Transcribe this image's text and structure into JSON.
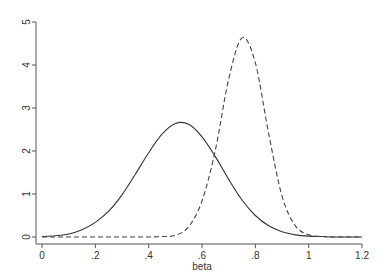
{
  "chart_data": {
    "type": "line",
    "title": "",
    "xlabel": "beta",
    "ylabel": "",
    "xlim": [
      0,
      1.2
    ],
    "ylim": [
      0,
      5
    ],
    "grid": false,
    "legend": null,
    "x_ticks": [
      0,
      0.2,
      0.4,
      0.6,
      0.8,
      1,
      1.2
    ],
    "x_tick_labels": [
      "0",
      ".2",
      ".4",
      ".6",
      ".8",
      "1",
      "1.2"
    ],
    "y_ticks": [
      0,
      1,
      2,
      3,
      4,
      5
    ],
    "y_tick_labels": [
      "0",
      "1",
      "2",
      "3",
      "4",
      "5"
    ],
    "x": [
      0,
      0.05,
      0.1,
      0.15,
      0.2,
      0.25,
      0.3,
      0.35,
      0.4,
      0.45,
      0.5,
      0.55,
      0.6,
      0.65,
      0.7,
      0.75,
      0.8,
      0.85,
      0.9,
      0.95,
      1.0,
      1.05,
      1.1,
      1.15,
      1.2
    ],
    "series": [
      {
        "name": "solid",
        "style": "solid",
        "peak": {
          "x": 0.51,
          "y": 2.65
        },
        "values": [
          0.01,
          0.03,
          0.07,
          0.17,
          0.34,
          0.6,
          0.98,
          1.46,
          1.96,
          2.39,
          2.64,
          2.62,
          2.33,
          1.87,
          1.34,
          0.86,
          0.5,
          0.26,
          0.12,
          0.05,
          0.02,
          0.01,
          0.0,
          0.0,
          0.0
        ]
      },
      {
        "name": "dashed",
        "style": "dashed",
        "peak": {
          "x": 0.757,
          "y": 4.63
        },
        "values": [
          0,
          0,
          0,
          0,
          0,
          0,
          0,
          0,
          0.0,
          0.01,
          0.04,
          0.24,
          0.84,
          2.02,
          3.67,
          4.63,
          4.05,
          2.4,
          0.95,
          0.26,
          0.05,
          0.01,
          0,
          0,
          0
        ]
      }
    ]
  }
}
